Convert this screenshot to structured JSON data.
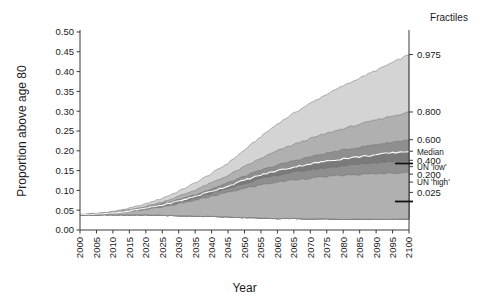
{
  "chart_data": {
    "type": "area",
    "title": "",
    "xlabel": "Year",
    "ylabel": "Proportion above age 80",
    "legend_title": "Fractiles",
    "legend_position": "right",
    "grid": false,
    "xlim": [
      2000,
      2100
    ],
    "ylim": [
      0.0,
      0.5
    ],
    "ytick_labels": [
      "0.00",
      "0.05",
      "0.10",
      "0.15",
      "0.20",
      "0.25",
      "0.30",
      "0.35",
      "0.40",
      "0.45",
      "0.50"
    ],
    "ytick_values": [
      0.0,
      0.05,
      0.1,
      0.15,
      0.2,
      0.25,
      0.3,
      0.35,
      0.4,
      0.45,
      0.5
    ],
    "xtick_labels": [
      "2000",
      "2005",
      "2010",
      "2015",
      "2020",
      "2025",
      "2030",
      "2035",
      "2040",
      "2045",
      "2050",
      "2055",
      "2060",
      "2065",
      "2070",
      "2075",
      "2080",
      "2085",
      "2090",
      "2095",
      "2100"
    ],
    "xtick_values": [
      2000,
      2005,
      2010,
      2015,
      2020,
      2025,
      2030,
      2035,
      2040,
      2045,
      2050,
      2055,
      2060,
      2065,
      2070,
      2075,
      2080,
      2085,
      2090,
      2095,
      2100
    ],
    "x": [
      2000,
      2005,
      2010,
      2015,
      2020,
      2025,
      2030,
      2035,
      2040,
      2045,
      2050,
      2055,
      2060,
      2065,
      2070,
      2075,
      2080,
      2085,
      2090,
      2095,
      2100
    ],
    "series": [
      {
        "name": "0.975",
        "fractile": 0.975,
        "color": "#d4d4d4",
        "values": [
          0.039,
          0.042,
          0.047,
          0.055,
          0.066,
          0.08,
          0.098,
          0.119,
          0.143,
          0.169,
          0.202,
          0.236,
          0.268,
          0.295,
          0.32,
          0.343,
          0.364,
          0.384,
          0.403,
          0.423,
          0.443
        ]
      },
      {
        "name": "0.800",
        "fractile": 0.8,
        "color": "#b0b0b0",
        "values": [
          0.039,
          0.041,
          0.045,
          0.051,
          0.06,
          0.071,
          0.085,
          0.101,
          0.119,
          0.138,
          0.16,
          0.181,
          0.2,
          0.216,
          0.231,
          0.244,
          0.256,
          0.267,
          0.278,
          0.288,
          0.298
        ]
      },
      {
        "name": "0.600",
        "fractile": 0.6,
        "color": "#8f8f8f",
        "values": [
          0.039,
          0.04,
          0.044,
          0.049,
          0.057,
          0.066,
          0.077,
          0.09,
          0.104,
          0.119,
          0.136,
          0.151,
          0.164,
          0.175,
          0.185,
          0.194,
          0.202,
          0.209,
          0.216,
          0.222,
          0.228
        ]
      },
      {
        "name": "Median",
        "fractile": 0.5,
        "color": "#7a7a7a",
        "values": [
          0.039,
          0.04,
          0.043,
          0.048,
          0.055,
          0.063,
          0.073,
          0.085,
          0.098,
          0.111,
          0.126,
          0.139,
          0.15,
          0.159,
          0.167,
          0.174,
          0.18,
          0.185,
          0.19,
          0.195,
          0.199
        ]
      },
      {
        "name": "0.400",
        "fractile": 0.4,
        "color": "#8f8f8f",
        "values": [
          0.039,
          0.04,
          0.043,
          0.047,
          0.054,
          0.061,
          0.07,
          0.081,
          0.093,
          0.105,
          0.118,
          0.129,
          0.138,
          0.146,
          0.152,
          0.157,
          0.162,
          0.166,
          0.17,
          0.173,
          0.176
        ]
      },
      {
        "name": "0.200",
        "fractile": 0.2,
        "color": "#b0b0b0",
        "values": [
          0.039,
          0.04,
          0.042,
          0.046,
          0.052,
          0.058,
          0.066,
          0.075,
          0.085,
          0.095,
          0.105,
          0.114,
          0.121,
          0.127,
          0.131,
          0.135,
          0.138,
          0.14,
          0.142,
          0.144,
          0.146
        ]
      },
      {
        "name": "0.025",
        "fractile": 0.025,
        "color": "#ffffff",
        "values": [
          0.038,
          0.038,
          0.038,
          0.038,
          0.038,
          0.037,
          0.036,
          0.035,
          0.034,
          0.033,
          0.031,
          0.03,
          0.029,
          0.029,
          0.028,
          0.028,
          0.027,
          0.027,
          0.027,
          0.027,
          0.028
        ]
      }
    ],
    "annotations": [
      {
        "label": "UN 'low'",
        "value": 0.168,
        "type": "tick-marker"
      },
      {
        "label": "UN 'high'",
        "value": 0.072,
        "type": "tick-marker"
      }
    ],
    "right_labels": [
      {
        "text": "0.975",
        "value": 0.443,
        "kind": "fractile"
      },
      {
        "text": "0.800",
        "value": 0.298,
        "kind": "fractile"
      },
      {
        "text": "0.600",
        "value": 0.228,
        "kind": "fractile"
      },
      {
        "text": "Median",
        "value": 0.199,
        "kind": "median"
      },
      {
        "text": "0.400",
        "value": 0.176,
        "kind": "fractile"
      },
      {
        "text": "UN 'low'",
        "value": 0.16,
        "kind": "un"
      },
      {
        "text": "0.200",
        "value": 0.141,
        "kind": "fractile"
      },
      {
        "text": "UN 'high'",
        "value": 0.121,
        "kind": "un"
      },
      {
        "text": "0.025",
        "value": 0.095,
        "kind": "fractile"
      }
    ]
  },
  "figure": {
    "background": "#ffffff",
    "axis_color": "#3a3a3a",
    "median_line_color": "#ffffff"
  }
}
